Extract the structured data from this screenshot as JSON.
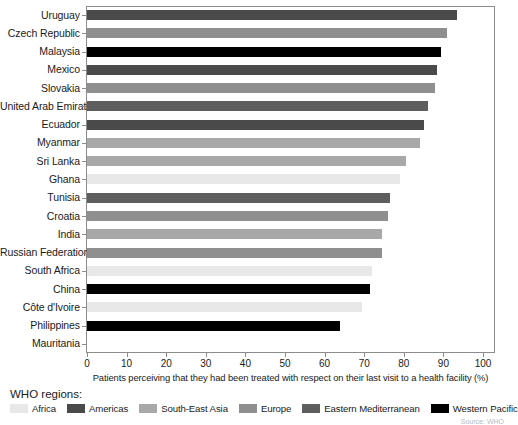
{
  "chart_data": {
    "type": "bar",
    "orientation": "horizontal",
    "title": "",
    "xlabel": "Patients perceiving that they had been treated with respect on their last visit to a health facility (%)",
    "ylabel": "",
    "xlim": [
      0,
      100
    ],
    "xticks": [
      0,
      10,
      20,
      30,
      40,
      50,
      60,
      70,
      80,
      90,
      100
    ],
    "grid": false,
    "legend_position": "bottom",
    "categories": [
      "Uruguay",
      "Czech Republic",
      "Malaysia",
      "Mexico",
      "Slovakia",
      "United Arab Emirates",
      "Ecuador",
      "Myanmar",
      "Sri Lanka",
      "Ghana",
      "Tunisia",
      "Croatia",
      "India",
      "Russian Federation",
      "South Africa",
      "China",
      "Côte d'Ivoire",
      "Philippines",
      "Mauritania"
    ],
    "values": [
      93.5,
      91,
      89.5,
      88.5,
      88,
      86,
      85,
      84,
      80.5,
      79,
      76.5,
      76,
      74.5,
      74.5,
      72,
      71.5,
      69.5,
      64,
      0
    ],
    "groups": [
      "Americas",
      "Europe",
      "Western Pacific",
      "Americas",
      "Europe",
      "Eastern Mediterranean",
      "Americas",
      "South-East Asia",
      "South-East Asia",
      "Africa",
      "Eastern Mediterranean",
      "Europe",
      "South-East Asia",
      "Europe",
      "Africa",
      "Western Pacific",
      "Africa",
      "Western Pacific",
      "Africa"
    ]
  },
  "legend": {
    "title": "WHO regions:",
    "items": [
      {
        "label": "Africa",
        "color": "#e8e8e8"
      },
      {
        "label": "Americas",
        "color": "#4a4a4a"
      },
      {
        "label": "South-East Asia",
        "color": "#a8a8a8"
      },
      {
        "label": "Europe",
        "color": "#8f8f8f"
      },
      {
        "label": "Eastern Mediterranean",
        "color": "#5e5e5e"
      },
      {
        "label": "Western Pacific",
        "color": "#000000"
      }
    ]
  },
  "colors": {
    "Africa": "#e8e8e8",
    "Americas": "#4a4a4a",
    "South-East Asia": "#a8a8a8",
    "Europe": "#8f8f8f",
    "Eastern Mediterranean": "#5e5e5e",
    "Western Pacific": "#000000",
    "axis": "#8c8c8c",
    "text": "#1a1a1a"
  },
  "source_note": "Source: WHO"
}
